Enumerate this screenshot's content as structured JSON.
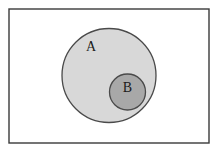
{
  "figure": {
    "type": "venn-diagram",
    "canvas": {
      "width": 221,
      "height": 153,
      "background_color": "#ffffff"
    },
    "universal_set": {
      "name": "universal-set-rectangle",
      "x": 9,
      "y": 9,
      "width": 200,
      "height": 134,
      "fill_color": "#ffffff",
      "stroke_color": "#3a3a3a",
      "stroke_width": 1.4,
      "label": ""
    },
    "sets": [
      {
        "id": "A",
        "label": "A",
        "shape": "circle",
        "cx": 109,
        "cy": 75.5,
        "r": 47,
        "fill_color": "#d8d8d8",
        "stroke_color": "#4a4a4a",
        "stroke_width": 1.3,
        "label_x": 91,
        "label_y": 48
      },
      {
        "id": "B",
        "label": "B",
        "shape": "circle",
        "cx": 127.5,
        "cy": 92,
        "r": 18,
        "fill_color": "#a8a8a8",
        "stroke_color": "#4a4a4a",
        "stroke_width": 1.3,
        "label_x": 127.5,
        "label_y": 89
      }
    ]
  }
}
